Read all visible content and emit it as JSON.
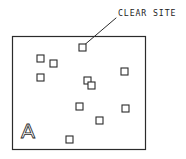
{
  "diagram": {
    "background_color": "#ffffff",
    "line_color": "#2b2b2b",
    "text_color": "#1c1c1c",
    "annotation": {
      "label": "CLEAR SITE",
      "text_x": 118,
      "text_y": 16,
      "leader": {
        "x1": 116,
        "y1": 18,
        "x2": 85.5,
        "y2": 44
      }
    },
    "site_boundary": {
      "name": "site-boundary-rectangle",
      "x": 12.5,
      "y": 36.5,
      "width": 133,
      "height": 113,
      "stroke_width": 1.2
    },
    "zone_label": {
      "text": "A",
      "x": 21,
      "y": 138
    },
    "obstruction_size": 7,
    "obstructions": [
      {
        "name": "obstruction-1",
        "x": 37,
        "y": 55
      },
      {
        "name": "obstruction-2",
        "x": 50,
        "y": 60
      },
      {
        "name": "obstruction-3",
        "x": 37,
        "y": 74
      },
      {
        "name": "obstruction-4",
        "x": 79,
        "y": 44
      },
      {
        "name": "obstruction-5",
        "x": 84,
        "y": 77
      },
      {
        "name": "obstruction-6",
        "x": 88,
        "y": 82
      },
      {
        "name": "obstruction-7",
        "x": 121,
        "y": 68
      },
      {
        "name": "obstruction-8",
        "x": 122,
        "y": 105
      },
      {
        "name": "obstruction-9",
        "x": 76,
        "y": 103
      },
      {
        "name": "obstruction-10",
        "x": 96,
        "y": 117
      },
      {
        "name": "obstruction-11",
        "x": 66,
        "y": 136
      }
    ]
  }
}
